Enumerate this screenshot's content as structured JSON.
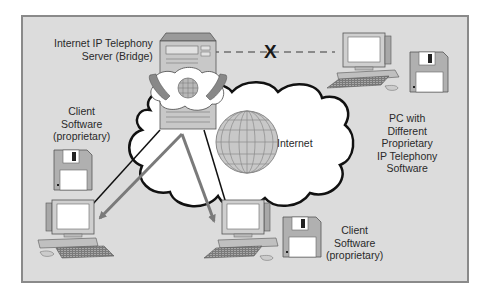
{
  "diagram": {
    "nodes": {
      "server": {
        "label_lines": [
          "Internet IP Telephony",
          "Server (Bridge)"
        ]
      },
      "internet": {
        "label": "Internet"
      },
      "client_left": {
        "label_lines": [
          "Client",
          "Software",
          "(proprietary)"
        ]
      },
      "client_bottom": {
        "label_lines": [
          "Client",
          "Software",
          "(proprietary)"
        ]
      },
      "pc_different": {
        "label_lines": [
          "PC with",
          "Different",
          "Proprietary",
          "IP Telephony",
          "Software"
        ]
      }
    },
    "connections": [
      {
        "from": "server",
        "to": "pc_different",
        "style": "dashed",
        "status": "blocked",
        "marker": "X"
      },
      {
        "from": "server",
        "to": "client_left",
        "style": "arrow",
        "color": "#7a7a7a"
      },
      {
        "from": "server",
        "to": "client_bottom",
        "style": "arrow",
        "color": "#7a7a7a"
      },
      {
        "from": "server",
        "to": "client_left",
        "style": "line",
        "color": "#1a1a1a"
      },
      {
        "from": "server",
        "to": "client_bottom",
        "style": "line",
        "color": "#1a1a1a"
      }
    ],
    "blocked_marker": "X",
    "colors": {
      "panel_bg": "#dcdcdc",
      "panel_border": "#8a8a8a",
      "cloud_fill": "#ffffff",
      "cloud_stroke": "#111111",
      "arrow_gray": "#7a7a7a",
      "globe_fill": "#c8c8c8"
    }
  }
}
